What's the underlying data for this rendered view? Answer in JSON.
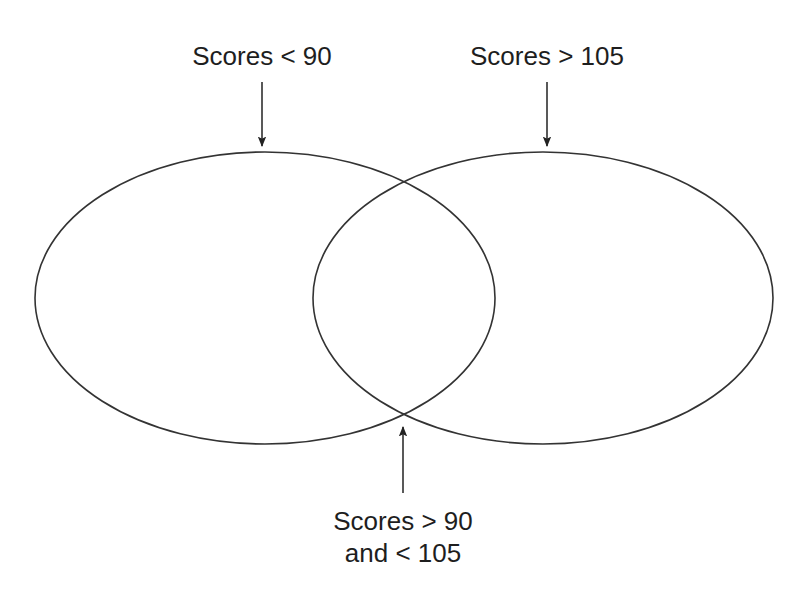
{
  "diagram": {
    "type": "venn",
    "sets": [
      {
        "id": "left",
        "label": "Scores < 90"
      },
      {
        "id": "right",
        "label": "Scores > 105"
      }
    ],
    "intersection": {
      "label_line1": "Scores > 90",
      "label_line2": "and < 105"
    },
    "colors": {
      "stroke": "#333333",
      "text": "#1e1e1e",
      "background": "#ffffff"
    }
  }
}
